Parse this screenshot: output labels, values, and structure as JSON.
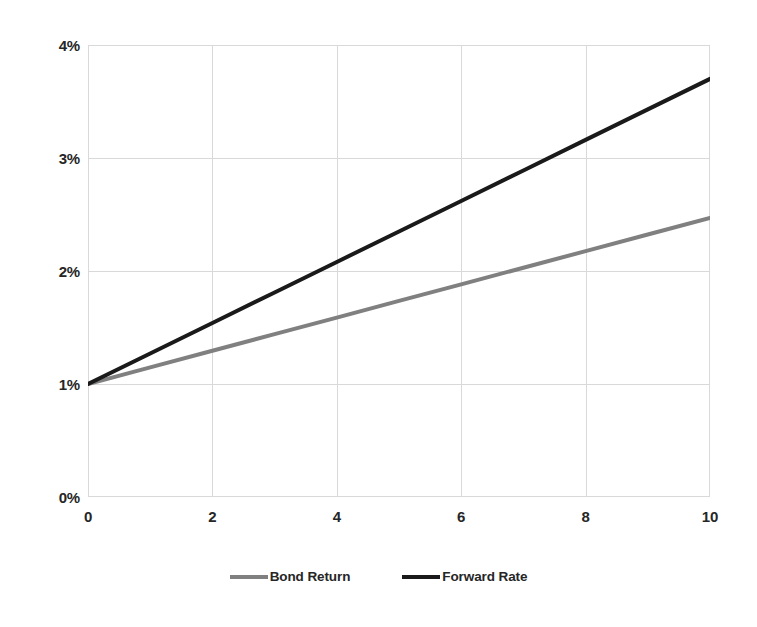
{
  "chart_data": {
    "type": "line",
    "title": "",
    "subtitle": "",
    "xlabel": "",
    "ylabel": "",
    "xlim": [
      0,
      10
    ],
    "ylim": [
      0,
      4
    ],
    "grid": true,
    "legend_position": "bottom",
    "x_tick_labels": [
      "0",
      "2",
      "4",
      "6",
      "8",
      "10"
    ],
    "x_tick_values": [
      0,
      2,
      4,
      6,
      8,
      10
    ],
    "y_tick_labels": [
      "0%",
      "1%",
      "2%",
      "3%",
      "4%"
    ],
    "y_tick_values": [
      0,
      1,
      2,
      3,
      4
    ],
    "x": [
      0,
      1,
      2,
      3,
      4,
      5,
      6,
      7,
      8,
      9,
      10
    ],
    "series": [
      {
        "name": "Bond Return",
        "color": "#808080",
        "values": [
          1.0,
          1.147,
          1.294,
          1.441,
          1.588,
          1.735,
          1.882,
          2.029,
          2.176,
          2.323,
          2.47
        ]
      },
      {
        "name": "Forward Rate",
        "color": "#1a1a1a",
        "values": [
          1.0,
          1.27,
          1.54,
          1.81,
          2.08,
          2.35,
          2.62,
          2.89,
          3.16,
          3.43,
          3.7
        ]
      }
    ]
  },
  "legend": {
    "entries": [
      {
        "label": "Bond Return",
        "color": "#808080"
      },
      {
        "label": "Forward Rate",
        "color": "#1a1a1a"
      }
    ]
  },
  "axes": {
    "y_labels": [
      "4%",
      "3%",
      "2%",
      "1%",
      "0%"
    ],
    "x_labels": [
      "0",
      "2",
      "4",
      "6",
      "8",
      "10"
    ]
  },
  "colors": {
    "bond_return": "#808080",
    "forward_rate": "#1a1a1a",
    "gridline": "#d9d9d9",
    "plot_border": "#d9d9d9",
    "text": "#262626",
    "background": "#ffffff"
  }
}
